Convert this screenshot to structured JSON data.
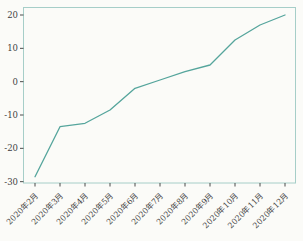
{
  "chart_data": {
    "type": "line",
    "title": "",
    "xlabel": "",
    "ylabel": "",
    "categories": [
      "2020年2月",
      "2020年3月",
      "2020年4月",
      "2020年5月",
      "2020年6月",
      "2020年7月",
      "2020年8月",
      "2020年9月",
      "2020年10月",
      "2020年11月",
      "2020年12月"
    ],
    "series": [
      {
        "name": "monthly-value",
        "values": [
          -28.5,
          -13.5,
          -12.5,
          -8.5,
          -2,
          0.5,
          3,
          5,
          12.5,
          17,
          20
        ]
      }
    ],
    "yticks": [
      20,
      10,
      0,
      -10,
      -20,
      -30
    ],
    "ylim": [
      -30.5,
      22.5
    ],
    "grid": false,
    "legend_position": "none",
    "colors": {
      "line": "#55a59c",
      "frame": "#a6cec8",
      "tick_mark": "#4b4b4b",
      "tick_text": "#3f3f3f",
      "background": "#fbfbf8"
    }
  }
}
